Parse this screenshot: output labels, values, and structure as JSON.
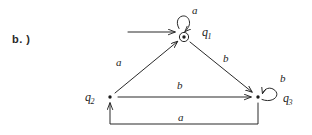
{
  "figure": {
    "part_label": "b. )",
    "caption": "",
    "background_color": "#ffffff",
    "stroke_color": "#1d1d1d"
  },
  "automaton": {
    "type": "finite-state-machine",
    "start_state": "q1",
    "accepting_states": [
      "q1"
    ],
    "states": [
      {
        "id": "q1",
        "label": "q",
        "subscript": "1",
        "x": 184,
        "y": 37,
        "shape": "circled-dot",
        "accepting": true,
        "start": true
      },
      {
        "id": "q2",
        "label": "q",
        "subscript": "2",
        "x": 110,
        "y": 97,
        "shape": "dot",
        "accepting": false,
        "start": false
      },
      {
        "id": "q3",
        "label": "q",
        "subscript": "3",
        "x": 258,
        "y": 97,
        "shape": "dot",
        "accepting": false,
        "start": false
      }
    ],
    "transitions": [
      {
        "from": "q1",
        "to": "q1",
        "symbol": "a",
        "kind": "self-loop-top"
      },
      {
        "from": "q2",
        "to": "q1",
        "symbol": "a",
        "kind": "diagonal"
      },
      {
        "from": "q1",
        "to": "q3",
        "symbol": "b",
        "kind": "diagonal"
      },
      {
        "from": "q2",
        "to": "q3",
        "symbol": "b",
        "kind": "horizontal"
      },
      {
        "from": "q3",
        "to": "q3",
        "symbol": "b",
        "kind": "self-loop-right"
      },
      {
        "from": "q3",
        "to": "q2",
        "symbol": "a",
        "kind": "bottom-routed"
      }
    ],
    "start_arrow": {
      "from_x": 128,
      "to_x": 176,
      "y": 32
    }
  }
}
